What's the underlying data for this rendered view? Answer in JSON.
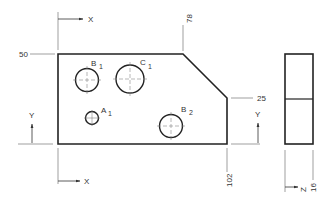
{
  "drawing": {
    "type": "orthographic technical drawing with ordinate dimensions",
    "colors": {
      "outline": "#222222",
      "dimension_line": "#777777",
      "center_line": "#888888",
      "text": "#333333"
    },
    "front_view": {
      "dimensions": {
        "top": "50",
        "chamfer_x": "78",
        "chamfer_y": "25",
        "right": "102"
      },
      "holes": [
        {
          "id": "B1",
          "letter": "B",
          "subscript": "1"
        },
        {
          "id": "C1",
          "letter": "C",
          "subscript": "1"
        },
        {
          "id": "A1",
          "letter": "A",
          "subscript": "1"
        },
        {
          "id": "B2",
          "letter": "B",
          "subscript": "2"
        }
      ],
      "axes": {
        "x_top": "X",
        "x_bottom": "X",
        "y_left": "Y",
        "y_right": "Y"
      }
    },
    "side_view": {
      "dimension": "16",
      "axis": "Z"
    }
  }
}
